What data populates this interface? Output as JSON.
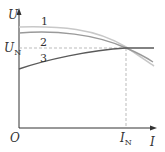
{
  "diagram": {
    "type": "generator-external-characteristic",
    "axes": {
      "y_label": "U",
      "x_label": "I",
      "origin_label": "O",
      "y_ref_label": "U",
      "y_ref_sub": "N",
      "x_ref_label": "I",
      "x_ref_sub": "N"
    },
    "curves": [
      {
        "id": "1",
        "label": "1",
        "color": "#c8c8c8",
        "description": "highest no-load voltage, falls below U_N past I_N"
      },
      {
        "id": "2",
        "label": "2",
        "color": "#9a9a9a",
        "description": "slightly lower start, passes through rated point"
      },
      {
        "id": "3",
        "label": "3",
        "color": "#5a5a5a",
        "description": "rising curve from below U_N, flat after rated point"
      }
    ],
    "colors": {
      "axis": "#333333",
      "dashed": "#aaaaaa"
    }
  }
}
